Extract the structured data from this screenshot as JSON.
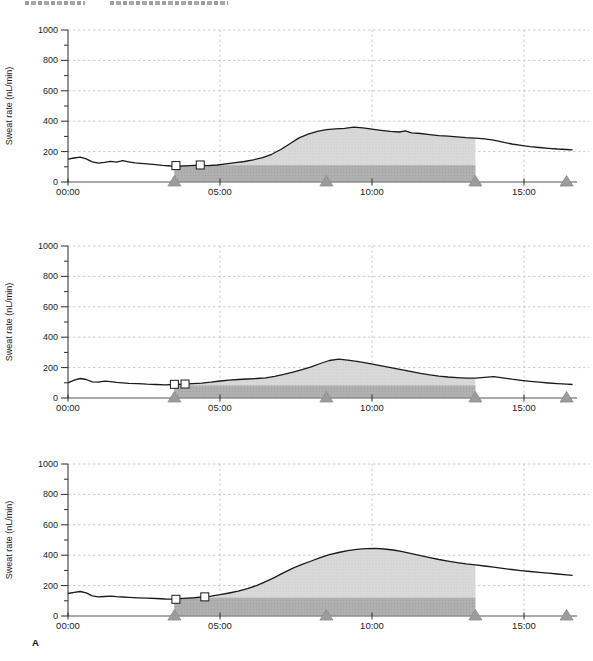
{
  "page": {
    "panel_label": "A"
  },
  "running_head": {
    "left_fragment_text": "",
    "right_fragment_text": "",
    "legible": false
  },
  "style": {
    "curve_color": "#1a1a1a",
    "shade_light_color": "#d9d9d9",
    "shade_light_dot": "#c9c9c9",
    "band_color": "#b0b0b0",
    "band_dot": "#a2a2a2",
    "triangle_color": "#9c9c9c",
    "triangle_edge": "#8a8a8a",
    "grid_color": "#cbcbcb",
    "x_axis_color": "#8c8c8c",
    "y_axis_color": "#2a2a2a",
    "square_marker_fill": "#ffffff",
    "square_marker_edge": "#1a1a1a"
  },
  "axes": {
    "ylabel": "Sweat rate (nL/min)",
    "ylim": [
      0,
      1000
    ],
    "ytick_major": [
      0,
      200,
      400,
      600,
      800,
      1000
    ],
    "ytick_minor": [
      100,
      300,
      500,
      700,
      900
    ],
    "grid_yvalues": [
      200,
      400,
      600,
      800,
      1000
    ],
    "xtick_hours": [
      0,
      5,
      10,
      15
    ],
    "xtick_labels": [
      "00:00",
      "05:00",
      "10:00",
      "15:00"
    ],
    "grid_xhours": [
      5,
      10,
      15
    ],
    "x_axis_end_hour": 16.75,
    "grid_end_hour": 17.15
  },
  "chart_data": [
    {
      "type": "line",
      "ylabel": "Sweat rate (nL/min)",
      "shade_start_hour": 3.5,
      "shade_end_hour": 13.4,
      "band_top_value": 110,
      "triangle_marker_hours": [
        3.5,
        8.5,
        13.4,
        16.4
      ],
      "square_markers": [
        {
          "hour": 3.55,
          "value": 108
        },
        {
          "hour": 4.35,
          "value": 112
        }
      ],
      "points": [
        [
          0,
          150
        ],
        [
          0.2,
          158
        ],
        [
          0.4,
          164
        ],
        [
          0.6,
          152
        ],
        [
          0.8,
          132
        ],
        [
          1.0,
          124
        ],
        [
          1.2,
          129
        ],
        [
          1.4,
          136
        ],
        [
          1.6,
          130
        ],
        [
          1.8,
          140
        ],
        [
          2.0,
          133
        ],
        [
          2.2,
          126
        ],
        [
          2.5,
          121
        ],
        [
          2.8,
          116
        ],
        [
          3.1,
          110
        ],
        [
          3.4,
          105
        ],
        [
          3.7,
          104
        ],
        [
          4.0,
          108
        ],
        [
          4.3,
          111
        ],
        [
          4.6,
          107
        ],
        [
          4.9,
          112
        ],
        [
          5.2,
          120
        ],
        [
          5.5,
          127
        ],
        [
          5.8,
          135
        ],
        [
          6.1,
          146
        ],
        [
          6.4,
          160
        ],
        [
          6.7,
          182
        ],
        [
          7.0,
          214
        ],
        [
          7.3,
          252
        ],
        [
          7.6,
          290
        ],
        [
          7.9,
          315
        ],
        [
          8.2,
          333
        ],
        [
          8.5,
          344
        ],
        [
          8.8,
          350
        ],
        [
          9.1,
          353
        ],
        [
          9.4,
          361
        ],
        [
          9.7,
          356
        ],
        [
          10.0,
          348
        ],
        [
          10.3,
          340
        ],
        [
          10.6,
          333
        ],
        [
          10.9,
          329
        ],
        [
          11.1,
          336
        ],
        [
          11.3,
          324
        ],
        [
          11.6,
          319
        ],
        [
          11.9,
          312
        ],
        [
          12.2,
          305
        ],
        [
          12.5,
          301
        ],
        [
          12.8,
          297
        ],
        [
          13.1,
          292
        ],
        [
          13.4,
          289
        ],
        [
          13.7,
          284
        ],
        [
          14.0,
          275
        ],
        [
          14.3,
          262
        ],
        [
          14.6,
          250
        ],
        [
          14.9,
          241
        ],
        [
          15.2,
          233
        ],
        [
          15.5,
          227
        ],
        [
          15.8,
          222
        ],
        [
          16.1,
          217
        ],
        [
          16.4,
          214
        ],
        [
          16.6,
          212
        ]
      ]
    },
    {
      "type": "line",
      "ylabel": "Sweat rate (nL/min)",
      "shade_start_hour": 3.5,
      "shade_end_hour": 13.4,
      "band_top_value": 82,
      "triangle_marker_hours": [
        3.5,
        8.5,
        13.4,
        16.4
      ],
      "square_markers": [
        {
          "hour": 3.5,
          "value": 90
        },
        {
          "hour": 3.85,
          "value": 92
        }
      ],
      "points": [
        [
          0,
          100
        ],
        [
          0.2,
          118
        ],
        [
          0.4,
          128
        ],
        [
          0.6,
          122
        ],
        [
          0.8,
          106
        ],
        [
          1.0,
          104
        ],
        [
          1.2,
          111
        ],
        [
          1.4,
          108
        ],
        [
          1.6,
          103
        ],
        [
          1.8,
          100
        ],
        [
          2.0,
          97
        ],
        [
          2.3,
          94
        ],
        [
          2.6,
          91
        ],
        [
          2.9,
          89
        ],
        [
          3.2,
          87
        ],
        [
          3.5,
          89
        ],
        [
          3.8,
          91
        ],
        [
          4.1,
          94
        ],
        [
          4.4,
          98
        ],
        [
          4.7,
          104
        ],
        [
          5.0,
          112
        ],
        [
          5.3,
          118
        ],
        [
          5.6,
          122
        ],
        [
          5.9,
          125
        ],
        [
          6.2,
          128
        ],
        [
          6.5,
          133
        ],
        [
          6.8,
          143
        ],
        [
          7.1,
          155
        ],
        [
          7.4,
          170
        ],
        [
          7.7,
          186
        ],
        [
          8.0,
          205
        ],
        [
          8.3,
          227
        ],
        [
          8.6,
          247
        ],
        [
          8.9,
          255
        ],
        [
          9.2,
          249
        ],
        [
          9.5,
          241
        ],
        [
          9.8,
          231
        ],
        [
          10.1,
          219
        ],
        [
          10.4,
          208
        ],
        [
          10.7,
          197
        ],
        [
          11.0,
          185
        ],
        [
          11.3,
          174
        ],
        [
          11.6,
          162
        ],
        [
          11.9,
          152
        ],
        [
          12.2,
          144
        ],
        [
          12.5,
          138
        ],
        [
          12.8,
          134
        ],
        [
          13.1,
          131
        ],
        [
          13.4,
          130
        ],
        [
          13.7,
          136
        ],
        [
          14.0,
          140
        ],
        [
          14.3,
          133
        ],
        [
          14.6,
          124
        ],
        [
          14.9,
          116
        ],
        [
          15.2,
          109
        ],
        [
          15.5,
          104
        ],
        [
          15.8,
          99
        ],
        [
          16.1,
          95
        ],
        [
          16.4,
          91
        ],
        [
          16.6,
          89
        ]
      ]
    },
    {
      "type": "line",
      "ylabel": "Sweat rate (nL/min)",
      "shade_start_hour": 3.5,
      "shade_end_hour": 13.4,
      "band_top_value": 120,
      "triangle_marker_hours": [
        3.5,
        8.5,
        13.4,
        16.4
      ],
      "square_markers": [
        {
          "hour": 3.55,
          "value": 110
        },
        {
          "hour": 4.5,
          "value": 126
        }
      ],
      "points": [
        [
          0,
          148
        ],
        [
          0.2,
          156
        ],
        [
          0.4,
          161
        ],
        [
          0.6,
          152
        ],
        [
          0.8,
          132
        ],
        [
          1.0,
          126
        ],
        [
          1.2,
          128
        ],
        [
          1.4,
          130
        ],
        [
          1.6,
          127
        ],
        [
          1.8,
          125
        ],
        [
          2.0,
          123
        ],
        [
          2.3,
          120
        ],
        [
          2.6,
          118
        ],
        [
          2.9,
          115
        ],
        [
          3.2,
          112
        ],
        [
          3.5,
          111
        ],
        [
          3.8,
          116
        ],
        [
          4.1,
          120
        ],
        [
          4.4,
          125
        ],
        [
          4.7,
          131
        ],
        [
          5.0,
          140
        ],
        [
          5.3,
          151
        ],
        [
          5.6,
          164
        ],
        [
          5.9,
          180
        ],
        [
          6.2,
          200
        ],
        [
          6.5,
          226
        ],
        [
          6.8,
          254
        ],
        [
          7.1,
          285
        ],
        [
          7.4,
          315
        ],
        [
          7.7,
          340
        ],
        [
          8.0,
          362
        ],
        [
          8.3,
          384
        ],
        [
          8.6,
          403
        ],
        [
          8.9,
          418
        ],
        [
          9.2,
          430
        ],
        [
          9.5,
          438
        ],
        [
          9.8,
          443
        ],
        [
          10.1,
          445
        ],
        [
          10.4,
          441
        ],
        [
          10.7,
          434
        ],
        [
          11.0,
          423
        ],
        [
          11.3,
          410
        ],
        [
          11.6,
          397
        ],
        [
          11.9,
          384
        ],
        [
          12.2,
          372
        ],
        [
          12.5,
          361
        ],
        [
          12.8,
          351
        ],
        [
          13.1,
          343
        ],
        [
          13.4,
          337
        ],
        [
          13.7,
          329
        ],
        [
          14.0,
          321
        ],
        [
          14.3,
          313
        ],
        [
          14.6,
          306
        ],
        [
          14.9,
          299
        ],
        [
          15.2,
          293
        ],
        [
          15.5,
          287
        ],
        [
          15.8,
          282
        ],
        [
          16.1,
          276
        ],
        [
          16.4,
          271
        ],
        [
          16.6,
          268
        ]
      ]
    }
  ]
}
